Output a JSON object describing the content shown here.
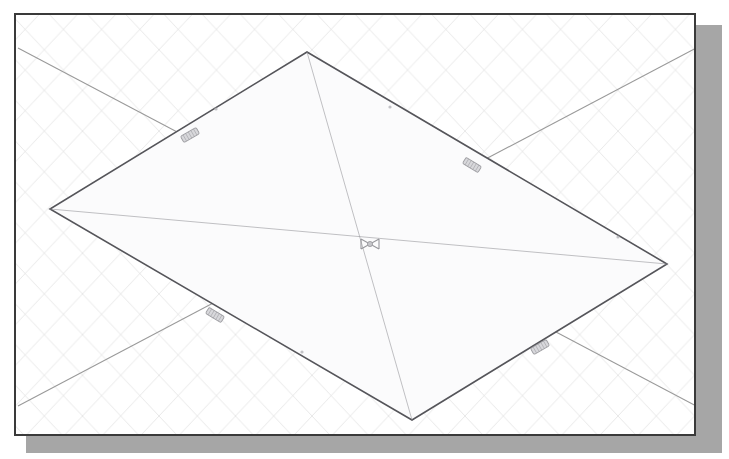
{
  "app": {
    "title": "3D Modeling Viewport",
    "view_label": "Isometric View"
  },
  "viewport": {
    "width": 729,
    "height": 459,
    "background_color": "#ffffff",
    "frame": {
      "x": 14,
      "y": 13,
      "width": 682,
      "height": 423,
      "border_color": "#3a3a3a",
      "border_width": 2
    },
    "shadow": {
      "x": 26,
      "y": 25,
      "width": 696,
      "height": 428,
      "color": "#a6a6a6"
    }
  },
  "grid": {
    "label": "isometric-grid",
    "line_color": "#dcdcdc",
    "line_width": 0.8,
    "spacing": 34,
    "angle_degrees": 28,
    "visible": true
  },
  "axes": {
    "label": "construction-axes",
    "line_color": "#9a9a9a",
    "line_width": 1.1,
    "lines": [
      {
        "name": "axis-x",
        "x1": 16,
        "y1": 46,
        "x2": 694,
        "y2": 404
      },
      {
        "name": "axis-y",
        "x1": 16,
        "y1": 404,
        "x2": 694,
        "y2": 46
      }
    ]
  },
  "shape": {
    "name": "rectangular-plane",
    "type": "parallelogram",
    "stroke_color": "#55555a",
    "stroke_width": 1.6,
    "fill_color": "#fbfbfc",
    "vertices": [
      {
        "label": "top",
        "x": 305,
        "y": 50
      },
      {
        "label": "right",
        "x": 665,
        "y": 262
      },
      {
        "label": "bottom",
        "x": 410,
        "y": 418
      },
      {
        "label": "left",
        "x": 48,
        "y": 207
      }
    ],
    "diagonals": [
      {
        "name": "diagonal-a",
        "x1": 305,
        "y1": 50,
        "x2": 410,
        "y2": 418
      },
      {
        "name": "diagonal-b",
        "x1": 48,
        "y1": 207,
        "x2": 665,
        "y2": 262
      }
    ]
  },
  "markers": {
    "center": {
      "name": "center-marker",
      "glyph": "x-cross-marker",
      "x": 368,
      "y": 242,
      "size": 18,
      "color": "#8d8d92"
    },
    "handles": [
      {
        "name": "edge-handle-upper-left",
        "x": 188,
        "y": 133,
        "rotation": -30,
        "color": "#8d8d92"
      },
      {
        "name": "edge-handle-upper-right",
        "x": 470,
        "y": 163,
        "rotation": 31,
        "color": "#8d8d92"
      },
      {
        "name": "edge-handle-lower-left",
        "x": 213,
        "y": 313,
        "rotation": 31,
        "color": "#8d8d92"
      },
      {
        "name": "edge-handle-lower-right",
        "x": 538,
        "y": 345,
        "rotation": -30,
        "color": "#8d8d92"
      }
    ],
    "edge_dots": [
      {
        "name": "edge-dot-upper-left",
        "x": 214,
        "y": 107
      },
      {
        "name": "edge-dot-upper-right",
        "x": 388,
        "y": 105
      },
      {
        "name": "edge-dot-right",
        "x": 616,
        "y": 235
      },
      {
        "name": "edge-dot-bottom",
        "x": 300,
        "y": 350
      }
    ]
  }
}
